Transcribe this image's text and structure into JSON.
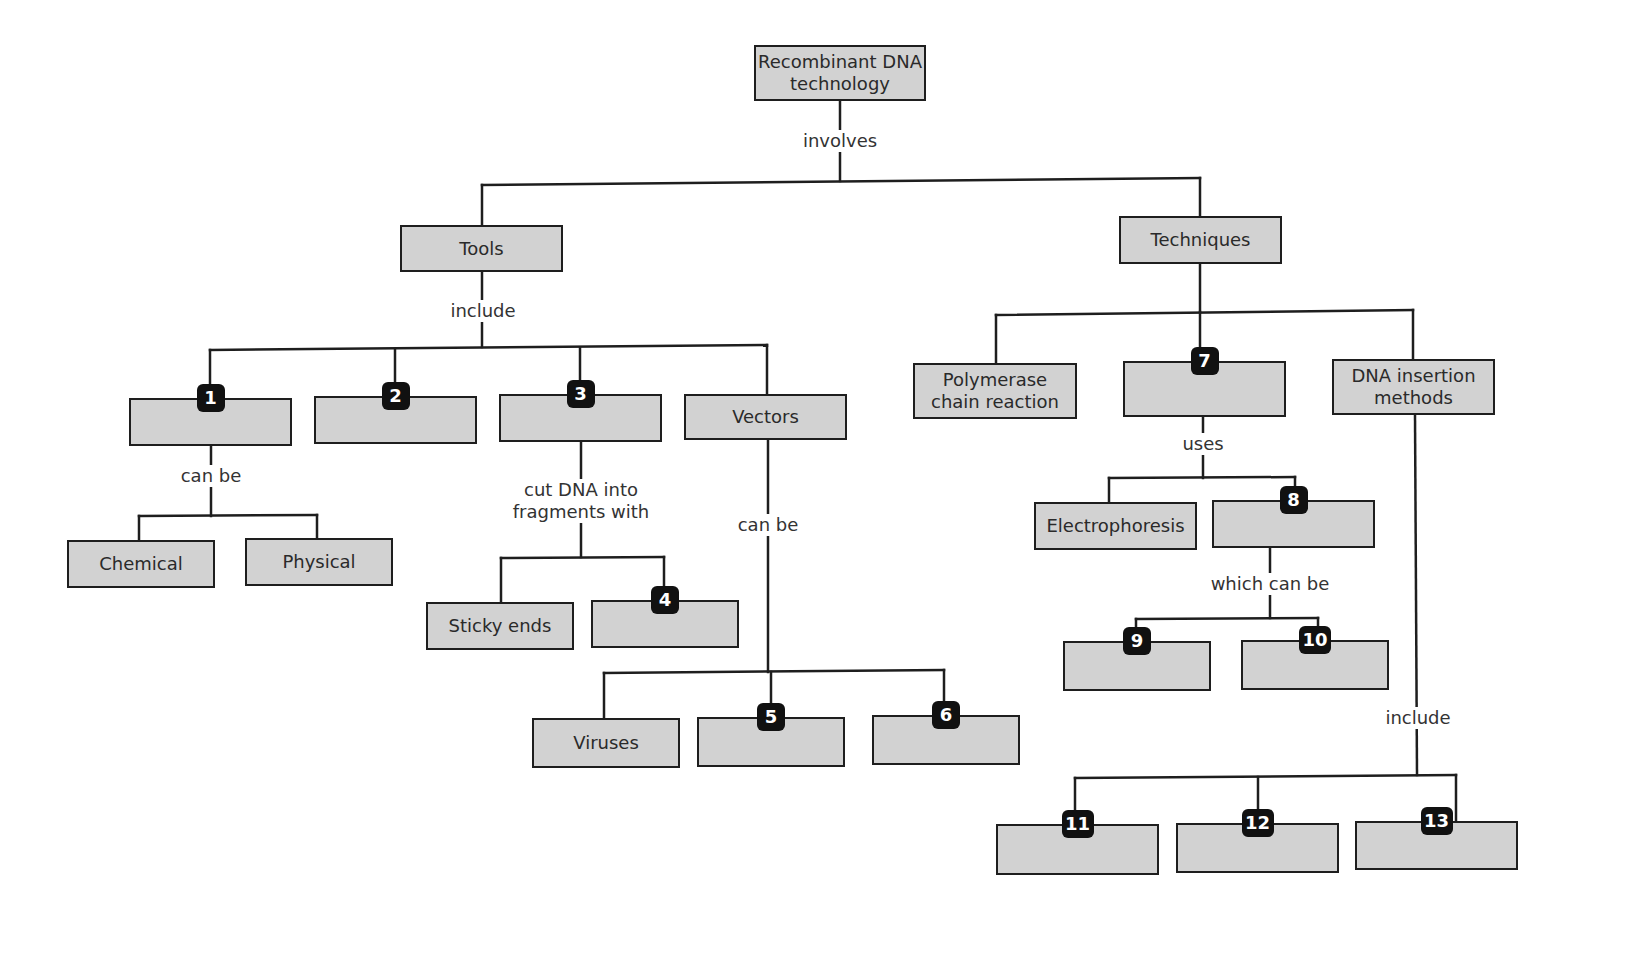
{
  "diagram": {
    "colors": {
      "box_fill": "#d2d2d2",
      "box_border": "#1e1e1e",
      "badge_fill": "#111111",
      "badge_text": "#ffffff",
      "line": "#1e1e1e",
      "text": "#2a2a2a"
    },
    "nodes": [
      {
        "id": "root",
        "text": "Recombinant DNA\ntechnology",
        "x": 754,
        "y": 45,
        "w": 172,
        "h": 56
      },
      {
        "id": "tools",
        "text": "Tools",
        "x": 400,
        "y": 225,
        "w": 163,
        "h": 47
      },
      {
        "id": "techniques",
        "text": "Techniques",
        "x": 1119,
        "y": 216,
        "w": 163,
        "h": 48
      },
      {
        "id": "b1",
        "text": "",
        "badge": "1",
        "x": 129,
        "y": 398,
        "w": 163,
        "h": 48
      },
      {
        "id": "b2",
        "text": "",
        "badge": "2",
        "x": 314,
        "y": 396,
        "w": 163,
        "h": 48
      },
      {
        "id": "b3",
        "text": "",
        "badge": "3",
        "x": 499,
        "y": 394,
        "w": 163,
        "h": 48
      },
      {
        "id": "vectors",
        "text": "Vectors",
        "x": 684,
        "y": 394,
        "w": 163,
        "h": 46
      },
      {
        "id": "chemical",
        "text": "Chemical",
        "x": 67,
        "y": 540,
        "w": 148,
        "h": 48
      },
      {
        "id": "physical",
        "text": "Physical",
        "x": 245,
        "y": 538,
        "w": 148,
        "h": 48
      },
      {
        "id": "sticky",
        "text": "Sticky ends",
        "x": 426,
        "y": 602,
        "w": 148,
        "h": 48
      },
      {
        "id": "b4",
        "text": "",
        "badge": "4",
        "x": 591,
        "y": 600,
        "w": 148,
        "h": 48
      },
      {
        "id": "viruses",
        "text": "Viruses",
        "x": 532,
        "y": 718,
        "w": 148,
        "h": 50
      },
      {
        "id": "b5",
        "text": "",
        "badge": "5",
        "x": 697,
        "y": 717,
        "w": 148,
        "h": 50
      },
      {
        "id": "b6",
        "text": "",
        "badge": "6",
        "x": 872,
        "y": 715,
        "w": 148,
        "h": 50
      },
      {
        "id": "pcr",
        "text": "Polymerase\nchain reaction",
        "x": 913,
        "y": 363,
        "w": 164,
        "h": 56
      },
      {
        "id": "b7",
        "text": "",
        "badge": "7",
        "x": 1123,
        "y": 361,
        "w": 163,
        "h": 56
      },
      {
        "id": "insertion",
        "text": "DNA insertion\nmethods",
        "x": 1332,
        "y": 359,
        "w": 163,
        "h": 56
      },
      {
        "id": "electro",
        "text": "Electrophoresis",
        "x": 1034,
        "y": 502,
        "w": 163,
        "h": 48
      },
      {
        "id": "b8",
        "text": "",
        "badge": "8",
        "x": 1212,
        "y": 500,
        "w": 163,
        "h": 48
      },
      {
        "id": "b9",
        "text": "",
        "badge": "9",
        "x": 1063,
        "y": 641,
        "w": 148,
        "h": 50
      },
      {
        "id": "b10",
        "text": "",
        "badge": "10",
        "x": 1241,
        "y": 640,
        "w": 148,
        "h": 50
      },
      {
        "id": "b11",
        "text": "",
        "badge": "11",
        "x": 996,
        "y": 824,
        "w": 163,
        "h": 51
      },
      {
        "id": "b12",
        "text": "",
        "badge": "12",
        "x": 1176,
        "y": 823,
        "w": 163,
        "h": 50
      },
      {
        "id": "b13",
        "text": "",
        "badge": "13",
        "x": 1355,
        "y": 821,
        "w": 163,
        "h": 49
      }
    ],
    "labels": [
      {
        "id": "involves",
        "text": "involves",
        "x": 840,
        "y": 130
      },
      {
        "id": "include-tools",
        "text": "include",
        "x": 483,
        "y": 300
      },
      {
        "id": "can-be-1",
        "text": "can be",
        "x": 211,
        "y": 465
      },
      {
        "id": "cut-dna",
        "text": "cut DNA into\nfragments with",
        "x": 581,
        "y": 479
      },
      {
        "id": "can-be-vectors",
        "text": "can be",
        "x": 768,
        "y": 514
      },
      {
        "id": "uses",
        "text": "uses",
        "x": 1203,
        "y": 433
      },
      {
        "id": "which-can-be",
        "text": "which can be",
        "x": 1270,
        "y": 573
      },
      {
        "id": "include-insertion",
        "text": "include",
        "x": 1418,
        "y": 707
      }
    ],
    "lines": [
      [
        840,
        101,
        840,
        181
      ],
      [
        482,
        185,
        1200,
        178
      ],
      [
        482,
        185,
        482,
        225
      ],
      [
        1200,
        178,
        1200,
        216
      ],
      [
        482,
        272,
        482,
        347
      ],
      [
        210,
        350,
        767,
        345
      ],
      [
        210,
        350,
        210,
        398
      ],
      [
        395,
        350,
        395,
        396
      ],
      [
        580,
        348,
        580,
        394
      ],
      [
        767,
        345,
        767,
        394
      ],
      [
        211,
        446,
        211,
        516
      ],
      [
        139,
        516,
        317,
        515
      ],
      [
        139,
        516,
        139,
        540
      ],
      [
        317,
        515,
        317,
        538
      ],
      [
        581,
        442,
        581,
        557
      ],
      [
        501,
        558,
        664,
        557
      ],
      [
        501,
        558,
        501,
        602
      ],
      [
        664,
        557,
        664,
        600
      ],
      [
        768,
        440,
        768,
        672
      ],
      [
        604,
        673,
        944,
        670
      ],
      [
        604,
        673,
        604,
        718
      ],
      [
        771,
        672,
        771,
        717
      ],
      [
        944,
        670,
        944,
        715
      ],
      [
        1200,
        264,
        1200,
        312
      ],
      [
        996,
        315,
        1413,
        310
      ],
      [
        996,
        315,
        996,
        363
      ],
      [
        1200,
        312,
        1200,
        361
      ],
      [
        1413,
        310,
        1413,
        359
      ],
      [
        1203,
        417,
        1203,
        478
      ],
      [
        1109,
        478,
        1295,
        477
      ],
      [
        1109,
        478,
        1109,
        502
      ],
      [
        1295,
        477,
        1295,
        500
      ],
      [
        1270,
        548,
        1270,
        618
      ],
      [
        1136,
        619,
        1318,
        618
      ],
      [
        1136,
        619,
        1136,
        641
      ],
      [
        1318,
        618,
        1318,
        640
      ],
      [
        1415,
        415,
        1417,
        775
      ],
      [
        1075,
        778,
        1456,
        775
      ],
      [
        1075,
        778,
        1075,
        824
      ],
      [
        1258,
        777,
        1258,
        823
      ],
      [
        1456,
        775,
        1456,
        821
      ]
    ]
  }
}
